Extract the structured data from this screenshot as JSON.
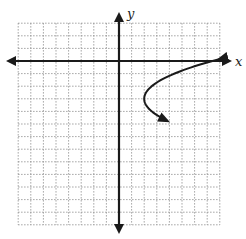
{
  "chart_data": {
    "type": "line",
    "title": "",
    "xlabel": "x",
    "ylabel": "y",
    "grid": true,
    "grid_style": "dotted",
    "xlim": [
      -8,
      8
    ],
    "ylim": [
      -13,
      3
    ],
    "legend": null,
    "series": [
      {
        "name": "sideways parabola (opens right)",
        "equation": "x = 0.6(y + 3)^2 + 2",
        "vertex": [
          2,
          -3
        ],
        "points": [
          [
            7.4,
            0
          ],
          [
            4.4,
            -1
          ],
          [
            2.6,
            -2
          ],
          [
            2,
            -3
          ],
          [
            2.6,
            -4
          ],
          [
            4.4,
            -5
          ]
        ],
        "arrows_at_ends": true
      }
    ]
  },
  "axes": {
    "x_label": "x",
    "y_label": "y"
  },
  "colors": {
    "axis": "#1a1a1a",
    "curve": "#1a1a1a",
    "grid": "#8a8a8a"
  }
}
